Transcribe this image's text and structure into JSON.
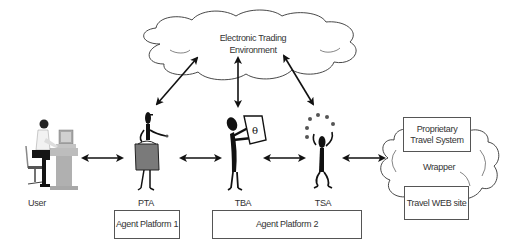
{
  "cloud": {
    "line1": "Electronic Trading",
    "line2": "Environment"
  },
  "actors": [
    {
      "id": "user",
      "label": "User"
    },
    {
      "id": "pta",
      "label": "PTA"
    },
    {
      "id": "tba",
      "label": "TBA"
    },
    {
      "id": "tsa",
      "label": "TSA"
    }
  ],
  "platforms": [
    {
      "label": "Agent Platform 1"
    },
    {
      "label": "Agent Platform 2"
    }
  ],
  "external": {
    "proprietary_line1": "Proprietary",
    "proprietary_line2": "Travel System",
    "wrapper": "Wrapper",
    "website": "Travel WEB site"
  },
  "colors": {
    "line": "#111111",
    "figure": "#111111",
    "gray_bag": "#7a7a7a",
    "desk": "#b8b8b8",
    "border": "#555555"
  }
}
